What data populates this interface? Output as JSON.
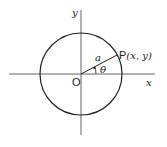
{
  "diagram": {
    "axes": {
      "x_label": "x",
      "y_label": "y",
      "origin_label": "O"
    },
    "circle": {
      "radius_label": "a"
    },
    "angle_label": "θ",
    "point_label": "P",
    "point_coords": "(x, y)",
    "colors": {
      "stroke": "#222222",
      "axis": "#555555",
      "background": "#ffffff"
    }
  }
}
